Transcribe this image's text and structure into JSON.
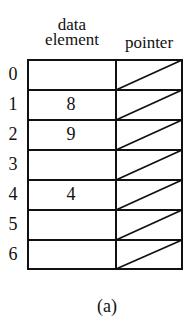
{
  "headers": {
    "data_element_line1": "data",
    "data_element_line2": "element",
    "pointer": "pointer"
  },
  "rows": [
    {
      "index": "0",
      "data": "",
      "pointer": "null"
    },
    {
      "index": "1",
      "data": "8",
      "pointer": "null"
    },
    {
      "index": "2",
      "data": "9",
      "pointer": "null"
    },
    {
      "index": "3",
      "data": "",
      "pointer": "null"
    },
    {
      "index": "4",
      "data": "4",
      "pointer": "null"
    },
    {
      "index": "5",
      "data": "",
      "pointer": "null"
    },
    {
      "index": "6",
      "data": "",
      "pointer": "null"
    }
  ],
  "caption": "(a)",
  "colors": {
    "line": "#111111",
    "background": "#ffffff"
  }
}
